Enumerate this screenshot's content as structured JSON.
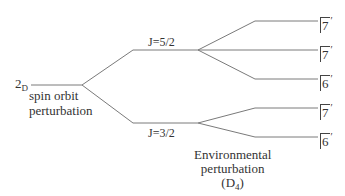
{
  "diagram": {
    "type": "energy-level-splitting",
    "term": {
      "main": "2",
      "sub": "D"
    },
    "spin_orbit_label": [
      "spin orbit",
      "perturbation"
    ],
    "levels": [
      {
        "label": "J=5/2"
      },
      {
        "label": "J=3/2"
      }
    ],
    "environment_label": [
      "Environmental",
      "perturbation"
    ],
    "environment_group": {
      "open": "(D",
      "sub": "4",
      "close": ")"
    },
    "states": [
      {
        "symbol": "7",
        "prime": "′"
      },
      {
        "symbol": "7",
        "prime": "′"
      },
      {
        "symbol": "6",
        "prime": "′"
      },
      {
        "symbol": "7",
        "prime": "′"
      },
      {
        "symbol": "6",
        "prime": "′"
      }
    ],
    "line_color": "#777777"
  }
}
